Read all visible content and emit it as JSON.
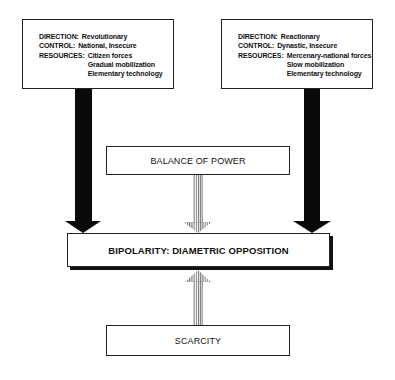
{
  "diagram": {
    "left_box": {
      "direction_label": "DIRECTION:",
      "direction_value": "Revolutionary",
      "control_label": "CONTROL:",
      "control_value": "National, Insecure",
      "resources_label": "RESOURCES:",
      "resources_values": [
        "Citizen forces",
        "Gradual mobilization",
        "Elementary technology"
      ]
    },
    "right_box": {
      "direction_label": "DIRECTION:",
      "direction_value": "Reactionary",
      "control_label": "CONTROL:",
      "control_value": "Dynastic, Insecure",
      "resources_label": "RESOURCES:",
      "resources_values": [
        "Mercenary-national forces",
        "Slow mobilization",
        "Elementary technology"
      ]
    },
    "balance_box": {
      "label": "BALANCE OF POWER"
    },
    "bipolarity_box": {
      "label": "BIPOLARITY: DIAMETRIC OPPOSITION"
    },
    "scarcity_box": {
      "label": "SCARCITY"
    },
    "arrows": [
      {
        "from": "left_box",
        "to": "bipolarity_box",
        "style": "solid-black"
      },
      {
        "from": "right_box",
        "to": "bipolarity_box",
        "style": "solid-black"
      },
      {
        "from": "balance_box",
        "to": "bipolarity_box",
        "style": "hatched-gray"
      },
      {
        "from": "scarcity_box",
        "to": "bipolarity_box",
        "style": "hatched-gray"
      }
    ]
  }
}
